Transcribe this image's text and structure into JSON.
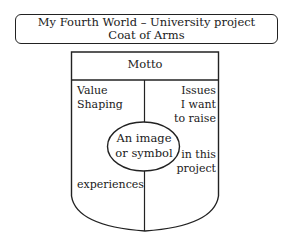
{
  "title": {
    "line1": "My Fourth World – University project",
    "line2": "Coat of Arms"
  },
  "shield": {
    "motto": "Motto",
    "left_top": [
      "Value",
      "Shaping"
    ],
    "right_top": [
      "Issues",
      "I want",
      "to raise"
    ],
    "center": [
      "An image",
      "or symbol"
    ],
    "right_bottom": [
      "in this",
      "project"
    ],
    "left_bottom": "experiences"
  },
  "colors": {
    "stroke": "#222222",
    "background": "#ffffff"
  }
}
